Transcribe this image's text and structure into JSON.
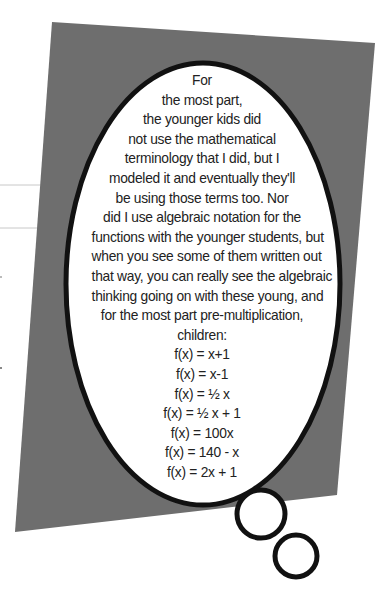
{
  "colors": {
    "background": "#ffffff",
    "card_gray": "#6e6e6e",
    "bubble_fill": "#ffffff",
    "bubble_outline": "#111111",
    "rule_lines": "#c8c8c8",
    "text": "#222222"
  },
  "thought_bubble": {
    "paragraph_lines": [
      "For",
      "the most part,",
      "the younger kids did",
      "not use the mathematical",
      "terminology that I did, but I",
      "modeled it and eventually they'll",
      "be using those terms too. Nor",
      "did I use algebraic notation for the",
      "functions with the younger students, but",
      "when you see some of them written out",
      "that way, you can really see the algebraic",
      "thinking going on with these young, and",
      "for the most part pre-multiplication,",
      "children:"
    ],
    "functions": [
      "f(x) = x+1",
      "f(x) = x-1",
      "f(x) = ½ x",
      "f(x) = ½ x + 1",
      "f(x) = 100x",
      "f(x) = 140 - x",
      "f(x) = 2x + 1"
    ]
  }
}
